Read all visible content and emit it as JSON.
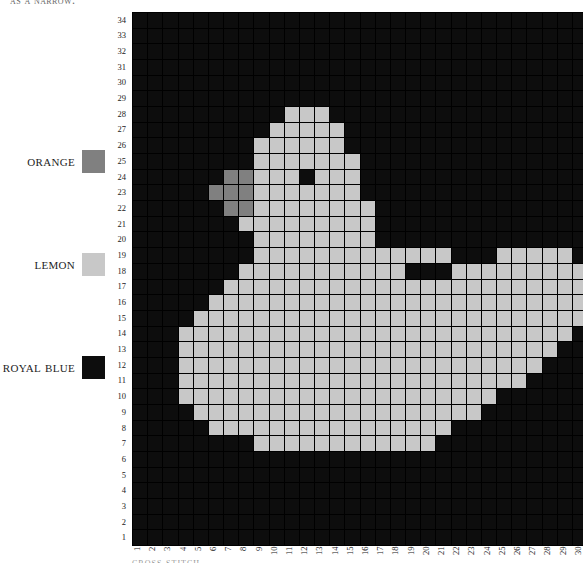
{
  "top_caption": "as a narrow.",
  "bottom_caption": "cross stitch",
  "legend": {
    "items": [
      {
        "label": "orange",
        "color": "#808080"
      },
      {
        "label": "lemon",
        "color": "#c8c8c8"
      },
      {
        "label": "royal blue",
        "color": "#0d0d0d"
      }
    ]
  },
  "chart_data": {
    "type": "heatmap",
    "xlabel": "",
    "ylabel": "",
    "grid": true,
    "legend_position": "left",
    "cols": 30,
    "rows": 34,
    "x": [
      1,
      2,
      3,
      4,
      5,
      6,
      7,
      8,
      9,
      10,
      11,
      12,
      13,
      14,
      15,
      16,
      17,
      18,
      19,
      20,
      21,
      22,
      23,
      24,
      25,
      26,
      27,
      28,
      29,
      30
    ],
    "y": [
      1,
      2,
      3,
      4,
      5,
      6,
      7,
      8,
      9,
      10,
      11,
      12,
      13,
      14,
      15,
      16,
      17,
      18,
      19,
      20,
      21,
      22,
      23,
      24,
      25,
      26,
      27,
      28,
      29,
      30,
      31,
      32,
      33,
      34
    ],
    "palette": {
      "B": "#0d0d0d",
      "L": "#c8c8c8",
      "O": "#808080"
    },
    "palette_names": {
      "B": "royal blue",
      "L": "lemon",
      "O": "orange"
    },
    "rows_top_to_bottom": [
      "BBBBBBBBBBBBBBBBBBBBBBBBBBBBBB",
      "BBBBBBBBBBBBBBBBBBBBBBBBBBBBBB",
      "BBBBBBBBBBBBBBBBBBBBBBBBBBBBBB",
      "BBBBBBBBBBBBBBBBBBBBBBBBBBBBBB",
      "BBBBBBBBBBBBBBBBBBBBBBBBBBBBBB",
      "BBBBBBBBBBBBBBBBBBBBBBBBBBBBBB",
      "BBBBBBBBBBLLLBBBBBBBBBBBBBBBBB",
      "BBBBBBBBBLLLLLBBBBBBBBBBBBBBBB",
      "BBBBBBBBLLLLLLBBBBBBBBBBBBBBBB",
      "BBBBBBBBLLLLLLLBBBBBBBBBBBBBBB",
      "BBBBBBOOLLLBLLLBBBBBBBBBBBBBBB",
      "BBBBBOOOLLLLLLLBBBBBBBBBBBBBBB",
      "BBBBBBOOLLLLLLLLBBBBBBBBBBBBBB",
      "BBBBBBBLLLLLLLLLBBBBBBBBBBBBBB",
      "BBBBBBBBLLLLLLLLBBBBBBBBBBBBBB",
      "BBBBBBBBLLLLLLLLLLLLLBBBLLLLLB",
      "BBBBBBBLLLLLLLLLLLBBBLLLLLLLLL",
      "BBBBBBLLLLLLLLLLLLLLLLLLLLLLLL",
      "BBBBBLLLLLLLLLLLLLLLLLLLLLLLLL",
      "BBBBLLLLLLLLLLLLLLLLLLLLLLLLLL",
      "BBBLLLLLLLLLLLLLLLLLLLLLLLLLLB",
      "BBBLLLLLLLLLLLLLLLLLLLLLLLLLBB",
      "BBBLLLLLLLLLLLLLLLLLLLLLLLLBBB",
      "BBBLLLLLLLLLLLLLLLLLLLLLLLBBBB",
      "BBBLLLLLLLLLLLLLLLLLLLLLBBBBBB",
      "BBBBLLLLLLLLLLLLLLLLLLLBBBBBBB",
      "BBBBBLLLLLLLLLLLLLLLLBBBBBBBBB",
      "BBBBBBBBLLLLLLLLLLLLBBBBBBBBBB",
      "BBBBBBBBBBBBBBBBBBBBBBBBBBBBBB",
      "BBBBBBBBBBBBBBBBBBBBBBBBBBBBBB",
      "BBBBBBBBBBBBBBBBBBBBBBBBBBBBBB",
      "BBBBBBBBBBBBBBBBBBBBBBBBBBBBBB",
      "BBBBBBBBBBBBBBBBBBBBBBBBBBBBBB",
      "BBBBBBBBBBBBBBBBBBBBBBBBBBBBBB"
    ]
  }
}
